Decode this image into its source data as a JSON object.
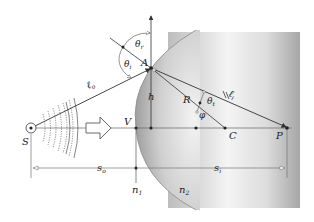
{
  "figure": {
    "colors": {
      "background": "#ffffff",
      "medium_dark": "#a9a9a9",
      "medium_light": "#f2f2f2",
      "line": "#333333",
      "guide": "#777777"
    },
    "labels": {
      "source": "S",
      "vertex": "V",
      "incidence_point": "A",
      "height": "h",
      "radius": "R",
      "center": "C",
      "image": "P",
      "object_path": "ℓ",
      "object_path_sub": "o",
      "image_path": "ℓ",
      "image_path_sub": "i",
      "theta_incident": "θ",
      "theta_incident_sub": "i",
      "theta_reflect": "θ",
      "theta_reflect_sub": "r",
      "theta_transmit": "θ",
      "theta_transmit_sub": "t",
      "phi": "φ",
      "object_distance": "s",
      "object_distance_sub": "o",
      "image_distance": "s",
      "image_distance_sub": "i",
      "n1": "n",
      "n1_sub": "1",
      "n2": "n",
      "n2_sub": "2"
    },
    "icons": {
      "source": "point-source-circle-icon",
      "propagation": "hollow-arrow-right-icon",
      "wavefronts": "wavefront-arcs-icon"
    }
  }
}
